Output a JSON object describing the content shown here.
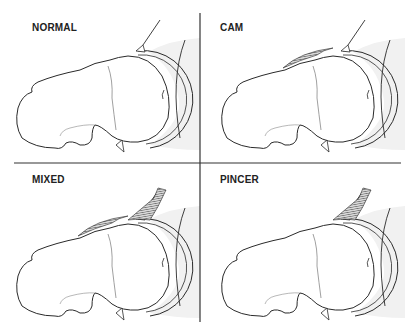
{
  "diagram": {
    "panels": [
      {
        "id": "normal",
        "label": "NORMAL",
        "cam_lesion": false,
        "pincer_lesion": false
      },
      {
        "id": "cam",
        "label": "CAM",
        "cam_lesion": true,
        "pincer_lesion": false
      },
      {
        "id": "mixed",
        "label": "MIXED",
        "cam_lesion": true,
        "pincer_lesion": true
      },
      {
        "id": "pincer",
        "label": "PINCER",
        "cam_lesion": false,
        "pincer_lesion": true
      }
    ],
    "colors": {
      "outline": "#2a2a2a",
      "hatch": "#555555",
      "shade": "#f1f1f1",
      "divider": "#333333"
    }
  }
}
